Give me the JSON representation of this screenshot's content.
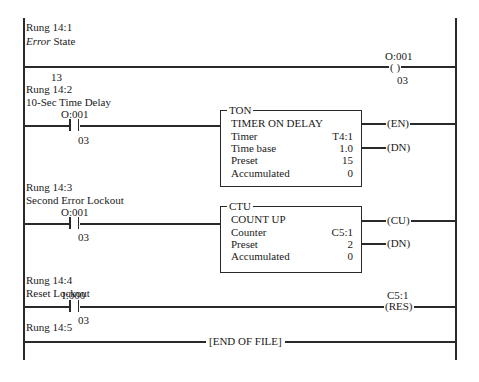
{
  "rails": {
    "left_x": 23,
    "right_x": 455,
    "top_y": 18,
    "bottom_y": 360
  },
  "rungs": [
    {
      "id": "14:1",
      "label": "Rung 14:1",
      "description_italic": "Error",
      "description_rest": " State",
      "coil": {
        "address": "O:001",
        "bit": "03",
        "symbol": "( )"
      },
      "cross_ref": "13"
    },
    {
      "id": "14:2",
      "label": "Rung 14:2",
      "description": "10-Sec Time Delay",
      "contact": {
        "address": "O:001",
        "bit": "03"
      },
      "block": {
        "type": "TON",
        "title": "TIMER ON DELAY",
        "fields": [
          {
            "name": "Timer",
            "value": "T4:1"
          },
          {
            "name": "Time base",
            "value": "1.0"
          },
          {
            "name": "Preset",
            "value": "15"
          },
          {
            "name": "Accumulated",
            "value": "0"
          }
        ],
        "outputs": [
          "(EN)",
          "(DN)"
        ]
      }
    },
    {
      "id": "14:3",
      "label": "Rung 14:3",
      "description": "Second Error Lockout",
      "contact": {
        "address": "O:001",
        "bit": "03"
      },
      "block": {
        "type": "CTU",
        "title": "COUNT UP",
        "fields": [
          {
            "name": "Counter",
            "value": "C5:1"
          },
          {
            "name": "Preset",
            "value": "2"
          },
          {
            "name": "Accumulated",
            "value": "0"
          }
        ],
        "outputs": [
          "(CU)",
          "(DN)"
        ]
      }
    },
    {
      "id": "14:4",
      "label": "Rung 14:4",
      "description": "Reset Lockout",
      "contact": {
        "address": "I:000",
        "bit": "03"
      },
      "coil": {
        "address": "C5:1",
        "symbol": "(RES)"
      }
    },
    {
      "id": "14:5",
      "label": "Rung 14:5",
      "end_label": "[END OF FILE]"
    }
  ]
}
